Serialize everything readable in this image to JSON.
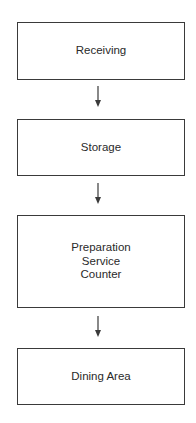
{
  "diagram": {
    "type": "flowchart",
    "direction": "top-to-bottom",
    "nodes": [
      {
        "id": "receiving",
        "lines": [
          "Receiving"
        ]
      },
      {
        "id": "storage",
        "lines": [
          "Storage"
        ]
      },
      {
        "id": "preparation",
        "lines": [
          "Preparation",
          "Service",
          "Counter"
        ]
      },
      {
        "id": "dining",
        "lines": [
          "Dining Area"
        ]
      }
    ],
    "edges": [
      {
        "from": "receiving",
        "to": "storage"
      },
      {
        "from": "storage",
        "to": "preparation"
      },
      {
        "from": "preparation",
        "to": "dining"
      }
    ],
    "colors": {
      "stroke": "#3a3a3a",
      "text": "#2a2a2a",
      "background": "#ffffff"
    }
  }
}
